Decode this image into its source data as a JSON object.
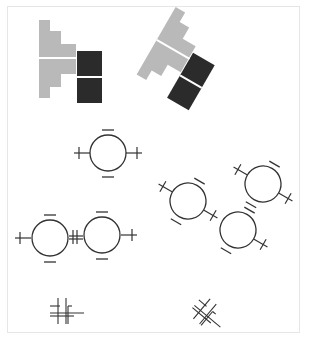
{
  "diagram": {
    "colors": {
      "gray_piece": "#b9b9b9",
      "black_piece": "#2b2b2b",
      "stroke": "#333333",
      "separator": "#ffffff",
      "frame": "#e6e6e6"
    },
    "pieces": [
      {
        "id": "piece-upright",
        "rotation_deg": 0
      },
      {
        "id": "piece-rotated",
        "rotation_deg": 30
      }
    ],
    "circles": {
      "single": {
        "cx": 108,
        "cy": 153,
        "r": 18,
        "left_charge": "+",
        "right_charge": "+",
        "top_charge": "−",
        "bottom_charge": "−"
      },
      "pair": [
        {
          "cx": 50,
          "cy": 238,
          "r": 19
        },
        {
          "cx": 102,
          "cy": 235,
          "r": 19
        }
      ],
      "trio_rotated": [
        {
          "cx": 188,
          "cy": 201,
          "r": 18
        },
        {
          "cx": 238,
          "cy": 230,
          "r": 18
        },
        {
          "cx": 263,
          "cy": 184,
          "r": 18
        }
      ]
    },
    "connectors": [
      {
        "id": "connector-upright",
        "rotation_deg": 0
      },
      {
        "id": "connector-rotated",
        "rotation_deg": 45
      }
    ]
  }
}
